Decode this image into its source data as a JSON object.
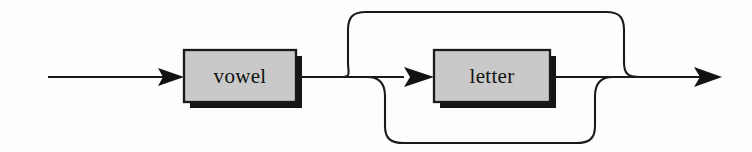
{
  "diagram": {
    "kind": "railroad-syntax-diagram",
    "background_color": "#fdfdfd",
    "line_color": "#1a1a1a",
    "node_fill_color": "#c9c9c9",
    "node_border_color": "#1a1a1a",
    "node_shadow_color": "#161616",
    "label_color": "#111111",
    "nodes": [
      {
        "id": "vowel",
        "label": "vowel",
        "shape": "rectangle",
        "x": 184,
        "y": 50,
        "width": 112,
        "height": 52
      },
      {
        "id": "letter",
        "label": "letter",
        "shape": "rectangle",
        "x": 434,
        "y": 50,
        "width": 116,
        "height": 52
      }
    ],
    "arrows": [
      {
        "id": "entry-arrow",
        "points_to": "vowel",
        "tip_x": 184,
        "tip_y": 77
      },
      {
        "id": "letter-arrow",
        "points_to": "letter",
        "tip_x": 434,
        "tip_y": 77
      },
      {
        "id": "exit-arrow",
        "points_to": "end",
        "tip_x": 722,
        "tip_y": 77
      }
    ],
    "paths": [
      {
        "id": "entry-line",
        "description": "entry rail into vowel",
        "from_x": 48,
        "to_x": 184,
        "y": 77
      },
      {
        "id": "vowel-to-branch",
        "description": "rail from vowel to branch point",
        "from_x": 296,
        "to_x": 404,
        "y": 77
      },
      {
        "id": "skip-branch",
        "description": "top bypass skipping letter",
        "top_y": 12,
        "left_x": 348,
        "right_x": 640
      },
      {
        "id": "repeat-loop",
        "description": "bottom loop repeating letter",
        "bottom_y": 143,
        "left_x": 385,
        "right_x": 595
      },
      {
        "id": "letter-to-exit",
        "description": "rail from letter to exit arrow",
        "from_x": 550,
        "to_x": 722,
        "y": 77
      }
    ]
  }
}
